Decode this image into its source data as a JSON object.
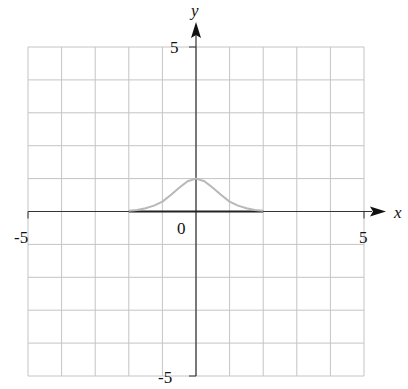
{
  "chart_data": {
    "type": "line",
    "title": "",
    "xlabel": "x",
    "ylabel": "y",
    "xlim": [
      -5,
      5
    ],
    "ylim": [
      -5,
      5
    ],
    "grid": true,
    "grid_step": 1,
    "tick_labels": {
      "x": [
        "-5",
        "0",
        "5"
      ],
      "y": [
        "5",
        "-5"
      ]
    },
    "series": [
      {
        "name": "curve",
        "color": "#b8b8b8",
        "x": [
          -2,
          -1.75,
          -1.5,
          -1.25,
          -1,
          -0.75,
          -0.5,
          -0.25,
          0,
          0.25,
          0.5,
          0.75,
          1,
          1.25,
          1.5,
          1.75,
          2
        ],
        "y": [
          0.02,
          0.05,
          0.1,
          0.18,
          0.3,
          0.5,
          0.72,
          0.92,
          1.0,
          0.92,
          0.72,
          0.5,
          0.3,
          0.18,
          0.1,
          0.05,
          0.02
        ]
      }
    ],
    "highlight_segment": {
      "x_from": -2,
      "x_to": 2,
      "y": 0,
      "color": "#222222"
    }
  },
  "labels": {
    "x_axis": "x",
    "y_axis": "y",
    "x_min": "-5",
    "x_max": "5",
    "y_max": "5",
    "y_min": "-5",
    "origin": "0"
  }
}
